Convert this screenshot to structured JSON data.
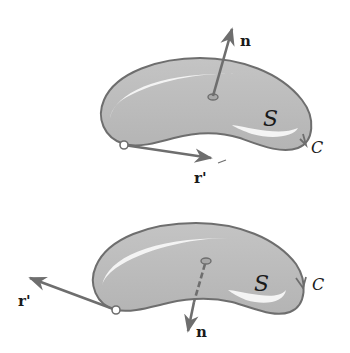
{
  "diagram": {
    "type": "surface-orientation",
    "colors": {
      "background": "#ffffff",
      "surface_fill": "#bdbdbd",
      "surface_edge": "#6e6e6e",
      "highlight": "#f4f4f4",
      "vector": "#6e6e6e",
      "text": "#1a1a1a"
    },
    "figures": [
      {
        "id": "top",
        "surface_label": "S",
        "curve_label": "C",
        "normal_label": "n",
        "tangent_label": "r'",
        "normal_direction": "up",
        "tangent_direction": "right"
      },
      {
        "id": "bottom",
        "surface_label": "S",
        "curve_label": "C",
        "normal_label": "n",
        "tangent_label": "r'",
        "normal_direction": "down",
        "tangent_direction": "left"
      }
    ]
  }
}
